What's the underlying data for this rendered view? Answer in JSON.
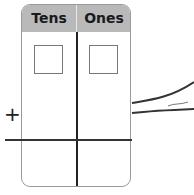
{
  "place_value_chart": {
    "columns": [
      {
        "label": "Tens"
      },
      {
        "label": "Ones"
      }
    ],
    "operator": "+",
    "header_color": "#b9b9b9",
    "border_color": "#9a9a9a"
  }
}
